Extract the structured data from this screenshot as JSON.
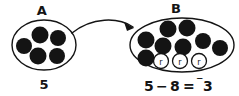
{
  "figure": {
    "kind": "integer-subtraction-counter-diagram",
    "background_color": "#ffffff",
    "ink_color": "#141414",
    "counter_fill": "#141414",
    "removed_counter_fill": "#ffffff"
  },
  "set_a": {
    "label": "A",
    "count_label": "5",
    "counter_count": 5,
    "ellipse": {
      "cx": 44,
      "cy": 45,
      "rx": 32,
      "ry": 25
    },
    "counters": [
      {
        "id": "a1",
        "cx": 24,
        "cy": 46,
        "r": 8
      },
      {
        "id": "a2",
        "cx": 40,
        "cy": 35,
        "r": 8.5
      },
      {
        "id": "a3",
        "cx": 58,
        "cy": 38,
        "r": 8
      },
      {
        "id": "a4",
        "cx": 38,
        "cy": 56,
        "r": 8.5
      },
      {
        "id": "a5",
        "cx": 57,
        "cy": 56,
        "r": 8
      }
    ]
  },
  "set_b": {
    "label": "B",
    "counter_count": 8,
    "removed_count": 3,
    "ellipse": {
      "cx": 182,
      "cy": 45,
      "rx": 52,
      "ry": 27
    },
    "counters": [
      {
        "id": "b1",
        "cx": 146,
        "cy": 40,
        "r": 8.5
      },
      {
        "id": "b2",
        "cx": 168,
        "cy": 29,
        "r": 8.5
      },
      {
        "id": "b3",
        "cx": 187,
        "cy": 28,
        "r": 8.5
      },
      {
        "id": "b4",
        "cx": 163,
        "cy": 46,
        "r": 8.5
      },
      {
        "id": "b5",
        "cx": 183,
        "cy": 47,
        "r": 8.5
      },
      {
        "id": "b6",
        "cx": 203,
        "cy": 41,
        "r": 8
      },
      {
        "id": "b7",
        "cx": 220,
        "cy": 48,
        "r": 8
      },
      {
        "id": "b8",
        "cx": 146,
        "cy": 58,
        "r": 8.5
      }
    ],
    "removed_counters": [
      {
        "id": "r1",
        "cx": 161,
        "cy": 61,
        "r": 7.5,
        "text": "r"
      },
      {
        "id": "r2",
        "cx": 180,
        "cy": 61,
        "r": 7.5,
        "text": "r"
      },
      {
        "id": "r3",
        "cx": 199,
        "cy": 61,
        "r": 7.5,
        "text": "r"
      }
    ]
  },
  "arrow": {
    "path": "M 72 33 C 92 17, 118 17, 133 27",
    "head_points": "133,27 126,24 128,31"
  },
  "equation": {
    "full_text": "5 − 8 = ⁻3",
    "minuend": "5",
    "operator": "−",
    "subtrahend": "8",
    "equals": "=",
    "negative_sign": "⁻",
    "result": "3",
    "result_signed": "⁻3"
  }
}
